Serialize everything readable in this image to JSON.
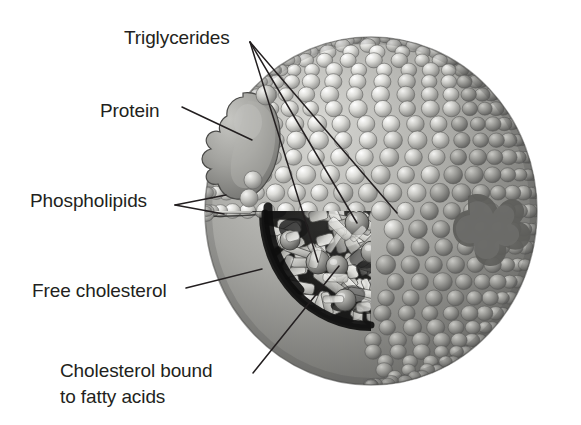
{
  "figure": {
    "style": "grayscale pencil/airbrush scientific illustration",
    "background_color": "#ffffff",
    "ink_color": "#231f20"
  },
  "labels": {
    "triglycerides": "Triglycerides",
    "protein": "Protein",
    "phospholipids": "Phospholipids",
    "free_cholesterol": "Free cholesterol",
    "cholesterol_bound_line1": "Cholesterol bound",
    "cholesterol_bound_line2": "to fatty acids"
  },
  "structures": {
    "outer_sphere": "phospholipid-monolayer-surface",
    "protein_blob": "apolipoprotein",
    "core": "lipid-core-with-triglyceride-and-cholesterol-ester-rods",
    "surface_beads": "phospholipid-head-groups",
    "tails": "fatty-acid-tails"
  },
  "colors": {
    "ink": "#231f20",
    "bead_light": "#e9e9e7",
    "bead_mid": "#b9b9b6",
    "bead_dark": "#8a8a87",
    "shadow": "#6f6f6d",
    "core_dark": "#1a1a1a",
    "rod_light": "#f0efec",
    "protein_fill": "#a3a3a0"
  },
  "leader_lines": {
    "triglycerides_count": 3,
    "phospholipids_count": 2,
    "protein_count": 1,
    "free_cholesterol_count": 1,
    "cholesterol_bound_count": 1
  }
}
